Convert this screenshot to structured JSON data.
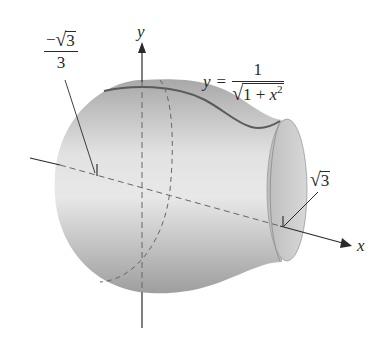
{
  "figure": {
    "type": "surface-of-revolution",
    "function_label": {
      "lhs": "y",
      "equals": "=",
      "numerator": "1",
      "denominator_radicand_pre": "1 + ",
      "denominator_var": "x",
      "denominator_exp": "2"
    },
    "axes": {
      "y_label": "y",
      "x_label": "x"
    },
    "annotations": {
      "left_bound": {
        "sign": "−",
        "radicand": "3",
        "denominator": "3"
      },
      "right_bound": {
        "radicand": "3"
      }
    },
    "colors": {
      "surface_light": "#e6e6e6",
      "surface_mid": "#c4c4c4",
      "surface_dark": "#9a9a9a",
      "curve": "#5a5a5a",
      "axis": "#2a2a2a",
      "dashed": "#666666"
    }
  }
}
